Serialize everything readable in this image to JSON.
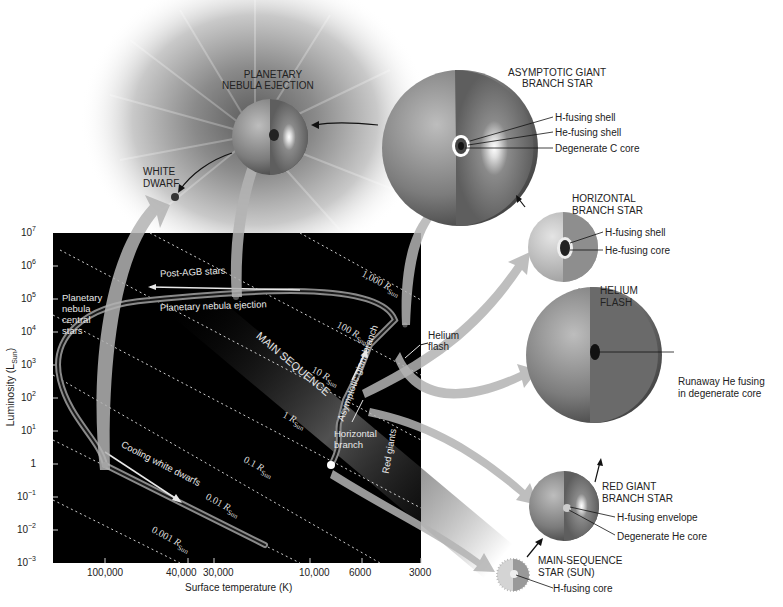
{
  "figure": {
    "type": "stellar evolution diagram (H-R diagram with star cross-sections)",
    "colors": {
      "plot_background": "#000000",
      "path": "#9a9a9a",
      "arrow_fill": "#b0b0b0",
      "label_text": "#222222",
      "plot_text": "#e8e8e8",
      "page_background": "#ffffff"
    }
  },
  "hr_diagram": {
    "y_axis": {
      "label": "Luminosity (L",
      "label_sub": "Sun",
      "label_close": ")",
      "ticks": [
        {
          "base": "10",
          "exp": "7"
        },
        {
          "base": "10",
          "exp": "6"
        },
        {
          "base": "10",
          "exp": "5"
        },
        {
          "base": "10",
          "exp": "4"
        },
        {
          "base": "10",
          "exp": "3"
        },
        {
          "base": "10",
          "exp": "2"
        },
        {
          "base": "10",
          "exp": "1"
        },
        {
          "base": "1",
          "exp": ""
        },
        {
          "base": "10",
          "exp": "−1"
        },
        {
          "base": "10",
          "exp": "−2"
        },
        {
          "base": "10",
          "exp": "−3"
        }
      ]
    },
    "x_axis": {
      "label": "Surface temperature (K)",
      "ticks": [
        "100,000",
        "40,000",
        "30,000",
        "10,000",
        "6000",
        "3000"
      ]
    },
    "radius_lines": [
      {
        "value": "1,000",
        "unit": "R",
        "sub": "Sun"
      },
      {
        "value": "100",
        "unit": "R",
        "sub": "Sun"
      },
      {
        "value": "10",
        "unit": "R",
        "sub": "Sun"
      },
      {
        "value": "1",
        "unit": "R",
        "sub": "Sun"
      },
      {
        "value": "0.1",
        "unit": "R",
        "sub": "Sun"
      },
      {
        "value": "0.01",
        "unit": "R",
        "sub": "Sun"
      },
      {
        "value": "0.001",
        "unit": "R",
        "sub": "Sun"
      }
    ],
    "annotations": {
      "main_sequence": "MAIN SEQUENCE",
      "post_agb": "Post-AGB stars",
      "pn_ejection": "Planetary nebula ejection",
      "pn_central_1": "Planetary",
      "pn_central_2": "nebula",
      "pn_central_3": "central",
      "pn_central_4": "stars",
      "agb": "Asymptotic giant branch",
      "horizontal_1": "Horizontal",
      "horizontal_2": "branch",
      "red_giants": "Red giants",
      "helium_flash_1": "Helium",
      "helium_flash_2": "flash",
      "cooling_wd": "Cooling white dwarfs"
    }
  },
  "stages": {
    "planetary_nebula": {
      "title_1": "PLANETARY",
      "title_2": "NEBULA EJECTION"
    },
    "white_dwarf": {
      "title_1": "WHITE",
      "title_2": "DWARF"
    },
    "agb_star": {
      "title_1": "ASYMPTOTIC GIANT",
      "title_2": "BRANCH STAR",
      "layers": [
        "H-fusing shell",
        "He-fusing shell",
        "Degenerate C core"
      ]
    },
    "horizontal_branch_star": {
      "title_1": "HORIZONTAL",
      "title_2": "BRANCH STAR",
      "layers": [
        "H-fusing shell",
        "He-fusing core"
      ]
    },
    "helium_flash": {
      "title_1": "HELIUM",
      "title_2": "FLASH",
      "layers": [
        "Runaway He fusing",
        "in degenerate core"
      ]
    },
    "red_giant_star": {
      "title_1": "RED GIANT",
      "title_2": "BRANCH STAR",
      "layers": [
        "H-fusing envelope",
        "Degenerate He core"
      ]
    },
    "main_sequence_star": {
      "title_1": "MAIN-SEQUENCE",
      "title_2": "STAR (SUN)",
      "layers": [
        "H-fusing core"
      ]
    }
  }
}
